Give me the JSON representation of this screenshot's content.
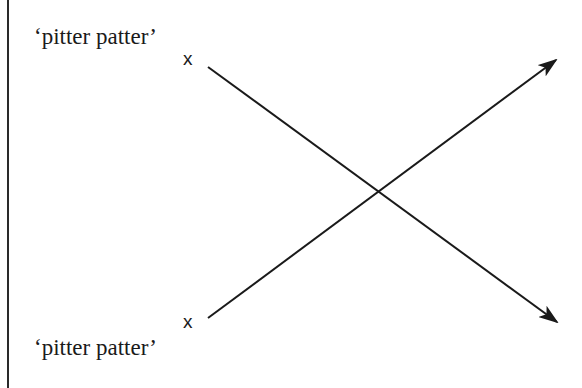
{
  "diagram": {
    "labels": {
      "top": "‘pitter patter’",
      "bottom": "‘pitter patter’"
    },
    "markers": {
      "top": "x",
      "bottom": "x"
    },
    "arrows": [
      {
        "name": "downward-arrow",
        "from": [
          208,
          67
        ],
        "to": [
          557,
          322
        ]
      },
      {
        "name": "upward-arrow",
        "from": [
          208,
          318
        ],
        "to": [
          556,
          60
        ]
      }
    ],
    "crossing_point": [
      378,
      192
    ],
    "colors": {
      "stroke": "#1a1a1a",
      "background": "#ffffff"
    }
  }
}
